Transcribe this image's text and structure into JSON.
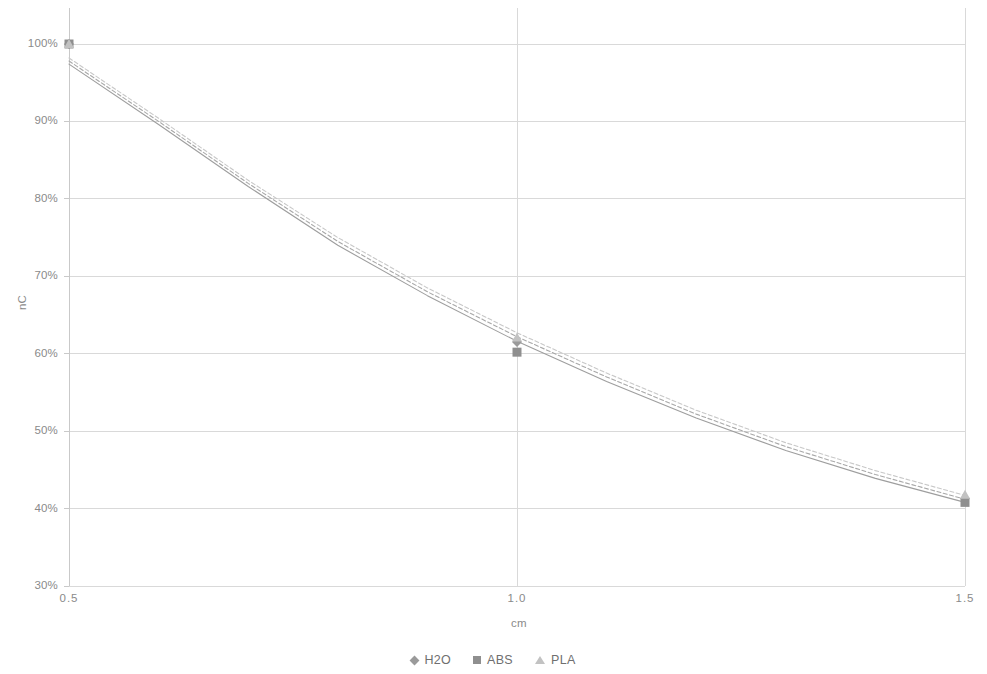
{
  "chart_data": {
    "type": "scatter",
    "title": "",
    "xlabel": "cm",
    "ylabel": "nC",
    "xlim": [
      0.5,
      1.5
    ],
    "ylim": [
      0.3,
      1.0
    ],
    "grid": true,
    "legend_position": "bottom",
    "x_tick_labels": [
      "0.5",
      "1.0",
      "1.5"
    ],
    "x_ticks": [
      0.5,
      1.0,
      1.5
    ],
    "y_tick_labels": [
      "30%",
      "40%",
      "50%",
      "60%",
      "70%",
      "80%",
      "90%",
      "100%"
    ],
    "y_ticks": [
      0.3,
      0.4,
      0.5,
      0.6,
      0.7,
      0.8,
      0.9,
      1.0
    ],
    "series": [
      {
        "name": "H2O",
        "marker": "diamond",
        "color": "#9a9a9a",
        "x": [
          0.5,
          1.0,
          1.5
        ],
        "values": [
          1.0,
          0.615,
          0.413
        ],
        "trend_color": "#a8a8a8",
        "trend_style": "dashed"
      },
      {
        "name": "ABS",
        "marker": "square",
        "color": "#8f8f8f",
        "x": [
          0.5,
          1.0,
          1.5
        ],
        "values": [
          1.0,
          0.602,
          0.408
        ],
        "trend_color": "#9e9e9e",
        "trend_style": "solid"
      },
      {
        "name": "PLA",
        "marker": "triangle",
        "color": "#c2c2c2",
        "x": [
          0.5,
          1.0,
          1.5
        ],
        "values": [
          1.0,
          0.621,
          0.418
        ],
        "trend_color": "#c8c8c8",
        "trend_style": "dashed"
      }
    ],
    "trendlines": [
      {
        "series": "H2O",
        "points": [
          [
            0.5,
            0.978
          ],
          [
            0.6,
            0.9
          ],
          [
            0.7,
            0.82
          ],
          [
            0.8,
            0.745
          ],
          [
            0.9,
            0.68
          ],
          [
            1.0,
            0.622
          ],
          [
            1.1,
            0.57
          ],
          [
            1.2,
            0.522
          ],
          [
            1.3,
            0.48
          ],
          [
            1.4,
            0.444
          ],
          [
            1.5,
            0.412
          ]
        ]
      },
      {
        "series": "ABS",
        "points": [
          [
            0.5,
            0.974
          ],
          [
            0.6,
            0.896
          ],
          [
            0.7,
            0.816
          ],
          [
            0.8,
            0.74
          ],
          [
            0.9,
            0.675
          ],
          [
            1.0,
            0.616
          ],
          [
            1.1,
            0.564
          ],
          [
            1.2,
            0.517
          ],
          [
            1.3,
            0.475
          ],
          [
            1.4,
            0.439
          ],
          [
            1.5,
            0.408
          ]
        ]
      },
      {
        "series": "PLA",
        "points": [
          [
            0.5,
            0.982
          ],
          [
            0.6,
            0.904
          ],
          [
            0.7,
            0.824
          ],
          [
            0.8,
            0.75
          ],
          [
            0.9,
            0.685
          ],
          [
            1.0,
            0.627
          ],
          [
            1.1,
            0.575
          ],
          [
            1.2,
            0.527
          ],
          [
            1.3,
            0.485
          ],
          [
            1.4,
            0.449
          ],
          [
            1.5,
            0.417
          ]
        ]
      }
    ],
    "axis_colors": {
      "gridline": "#d9d9d9",
      "axis_line": "#c9c9c9",
      "tick_text": "#8a8a8a"
    }
  },
  "legend": {
    "entries": [
      {
        "label": "H2O"
      },
      {
        "label": "ABS"
      },
      {
        "label": "PLA"
      }
    ]
  }
}
